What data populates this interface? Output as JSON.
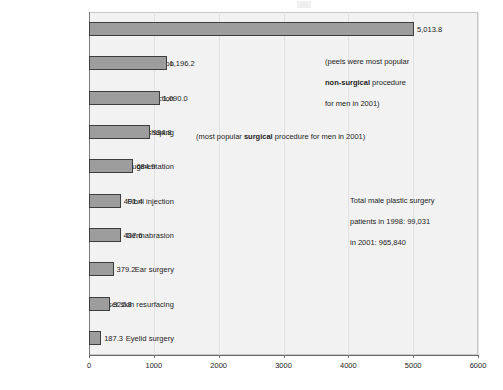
{
  "chart_data": {
    "type": "bar",
    "orientation": "horizontal",
    "title": "",
    "subtitle": "",
    "xlabel": "",
    "ylabel": "",
    "xlim": [
      0,
      6000
    ],
    "xticks": [
      0,
      1000,
      2000,
      3000,
      4000,
      5000,
      6000
    ],
    "xtick_labels": [
      "0",
      "1000",
      "2000",
      "3000",
      "4000",
      "5000",
      "6000"
    ],
    "grid": false,
    "legend": false,
    "bar_color": "#9d9d9d",
    "bar_edge_color": "#3d3d3d",
    "plot_background": "#f2f2f2",
    "categories": [
      "Chemical peels",
      "Hair transplantation",
      "Collagen injection",
      "Nose reshaping",
      "Chin augmentation",
      "Fibril injection",
      "Dermabrasion",
      "Ear surgery",
      "Laser skin resurfacing",
      "Eyelid surgery"
    ],
    "values": [
      5013.8,
      1196.2,
      1090.0,
      934.8,
      684.9,
      491.4,
      487.6,
      379.2,
      322.8,
      187.3
    ],
    "value_labels": [
      "5,013.8",
      "1,196.2",
      "1,090.0",
      "934.8",
      "684.9",
      "491.4",
      "487.6",
      "379.2",
      "322.8",
      "187.3"
    ],
    "annotations": [
      {
        "id": "peels-note",
        "line1": "(peels were most popular",
        "bold": "non-surgical",
        "line2_suffix": " procedure",
        "line3": "for men in 2001)"
      },
      {
        "id": "nose-note",
        "prefix": "(most popular ",
        "bold": "surgical",
        "suffix": " procedure for men in 2001)"
      },
      {
        "id": "totals-note",
        "line1": "Total male plastic surgery",
        "line2": "patients in 1998: 99,031",
        "line3": "in 2001: 965,840"
      }
    ]
  }
}
